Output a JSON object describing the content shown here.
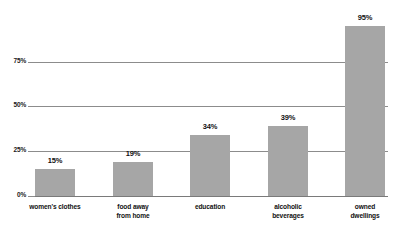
{
  "chart_data": {
    "type": "bar",
    "title": "",
    "subtitle": "",
    "xlabel": "",
    "ylabel": "",
    "categories": [
      "women's clothes",
      "food away from home",
      "education",
      "alcoholic beverages",
      "owned dwellings"
    ],
    "category_lines": [
      [
        "women's clothes"
      ],
      [
        "food away",
        "from home"
      ],
      [
        "education"
      ],
      [
        "alcoholic",
        "beverages"
      ],
      [
        "owned",
        "dwellings"
      ]
    ],
    "values": [
      15,
      19,
      34,
      39,
      95
    ],
    "value_labels": [
      "15%",
      "19%",
      "34%",
      "39%",
      "95%"
    ],
    "ylim": [
      0,
      100
    ],
    "yticks": [
      0,
      25,
      50,
      75
    ],
    "ytick_labels": [
      "0%",
      "25%",
      "50%",
      "75%"
    ],
    "grid": true,
    "legend": false,
    "legend_position": "none",
    "colors": {
      "bar": "#a6a6a6",
      "gridline": "#8c8c8c",
      "axis": "#7a7a7a",
      "text": "#111111",
      "background": "#ffffff"
    }
  }
}
